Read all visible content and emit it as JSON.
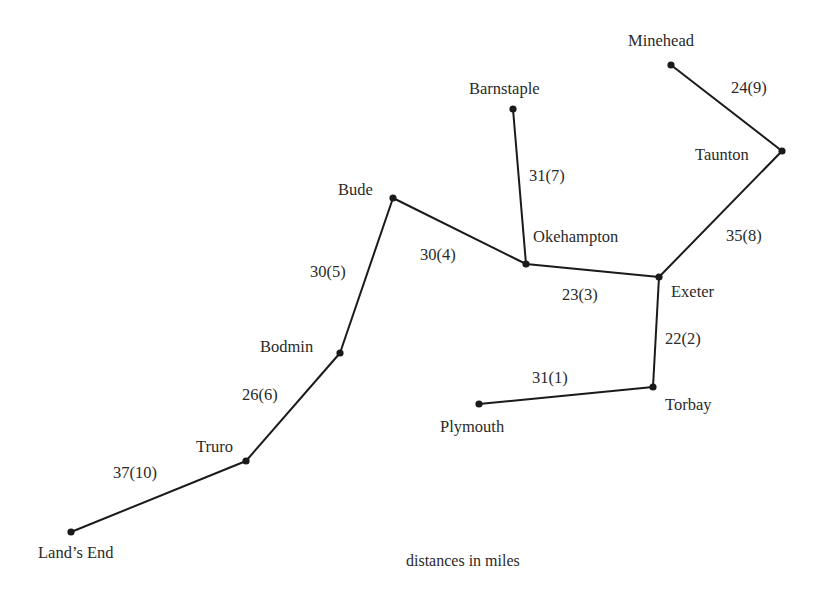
{
  "diagram": {
    "caption": "distances in miles",
    "line_color": "#1a1a1a",
    "nodes": [
      {
        "id": "minehead",
        "name": "Minehead",
        "x": 671,
        "y": 65,
        "label_x": 628,
        "label_y": 33
      },
      {
        "id": "barnstaple",
        "name": "Barnstaple",
        "x": 513,
        "y": 109,
        "label_x": 469,
        "label_y": 81
      },
      {
        "id": "taunton",
        "name": "Taunton",
        "x": 782,
        "y": 151,
        "label_x": 695,
        "label_y": 147
      },
      {
        "id": "bude",
        "name": "Bude",
        "x": 393,
        "y": 198,
        "label_x": 338,
        "label_y": 182
      },
      {
        "id": "okehampton",
        "name": "Okehampton",
        "x": 526,
        "y": 264,
        "label_x": 533,
        "label_y": 229
      },
      {
        "id": "exeter",
        "name": "Exeter",
        "x": 659,
        "y": 277,
        "label_x": 671,
        "label_y": 284
      },
      {
        "id": "bodmin",
        "name": "Bodmin",
        "x": 340,
        "y": 353,
        "label_x": 260,
        "label_y": 339
      },
      {
        "id": "torbay",
        "name": "Torbay",
        "x": 653,
        "y": 387,
        "label_x": 665,
        "label_y": 397
      },
      {
        "id": "plymouth",
        "name": "Plymouth",
        "x": 479,
        "y": 404,
        "label_x": 440,
        "label_y": 419
      },
      {
        "id": "truro",
        "name": "Truro",
        "x": 246,
        "y": 461,
        "label_x": 196,
        "label_y": 439
      },
      {
        "id": "lands_end",
        "name": "Land’s End",
        "x": 71,
        "y": 532,
        "label_x": 38,
        "label_y": 545
      }
    ],
    "edges": [
      {
        "from": "plymouth",
        "to": "torbay",
        "distance": 31,
        "order": 1,
        "label": "31(1)",
        "label_x": 532,
        "label_y": 370
      },
      {
        "from": "torbay",
        "to": "exeter",
        "distance": 22,
        "order": 2,
        "label": "22(2)",
        "label_x": 665,
        "label_y": 331
      },
      {
        "from": "exeter",
        "to": "okehampton",
        "distance": 23,
        "order": 3,
        "label": "23(3)",
        "label_x": 562,
        "label_y": 287
      },
      {
        "from": "okehampton",
        "to": "bude",
        "distance": 30,
        "order": 4,
        "label": "30(4)",
        "label_x": 420,
        "label_y": 247
      },
      {
        "from": "bude",
        "to": "bodmin",
        "distance": 30,
        "order": 5,
        "label": "30(5)",
        "label_x": 310,
        "label_y": 264
      },
      {
        "from": "bodmin",
        "to": "truro",
        "distance": 26,
        "order": 6,
        "label": "26(6)",
        "label_x": 242,
        "label_y": 387
      },
      {
        "from": "barnstaple",
        "to": "okehampton",
        "distance": 31,
        "order": 7,
        "label": "31(7)",
        "label_x": 529,
        "label_y": 168
      },
      {
        "from": "exeter",
        "to": "taunton",
        "distance": 35,
        "order": 8,
        "label": "35(8)",
        "label_x": 726,
        "label_y": 228
      },
      {
        "from": "minehead",
        "to": "taunton",
        "distance": 24,
        "order": 9,
        "label": "24(9)",
        "label_x": 731,
        "label_y": 80
      },
      {
        "from": "truro",
        "to": "lands_end",
        "distance": 37,
        "order": 10,
        "label": "37(10)",
        "label_x": 113,
        "label_y": 465
      }
    ]
  }
}
